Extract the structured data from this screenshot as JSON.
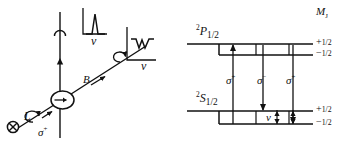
{
  "figure": {
    "line_color": "#111111",
    "background": "#ffffff"
  },
  "left_panel": {
    "name": "experimental-setup",
    "source_label": "L",
    "source_icon": "circled-cross-laser-icon",
    "polarization_label_text": "σ",
    "polarization_label_sign": "+",
    "field_label": "B",
    "cell_icon": "vapor-cell-icon",
    "beam_rotation_icon": "circular-polarization-arrow-icon",
    "transmission_rotation_icon": "circular-polarization-arrow-icon",
    "detector_arc_icon": "detector-arc-icon",
    "inset_top": {
      "name": "fluorescence-spectrum-inset",
      "axis_label": "ν",
      "trace_type": "peak"
    },
    "inset_right": {
      "name": "transmission-spectrum-inset",
      "axis_label": "ν",
      "trace_type": "dip"
    }
  },
  "right_panel": {
    "name": "energy-level-diagram",
    "quantum_number_header": "M",
    "quantum_number_header_sub": "J",
    "upper_state": {
      "term_sup": "2",
      "term_letter": "P",
      "term_sub": "1/2",
      "sublevels": [
        {
          "sign": "+",
          "value": "1/2"
        },
        {
          "sign": "−",
          "value": "1/2"
        }
      ]
    },
    "lower_state": {
      "term_sup": "2",
      "term_letter": "S",
      "term_sub": "1/2",
      "sublevels": [
        {
          "sign": "+",
          "value": "1/2"
        },
        {
          "sign": "−",
          "value": "1/2"
        }
      ]
    },
    "transitions": [
      {
        "label": "σ",
        "sign": "+",
        "direction": "up"
      },
      {
        "label": "σ",
        "sign": "−",
        "direction": "down"
      },
      {
        "label": "σ",
        "sign": "+",
        "direction": "down"
      }
    ],
    "splitting_label": "ν"
  }
}
